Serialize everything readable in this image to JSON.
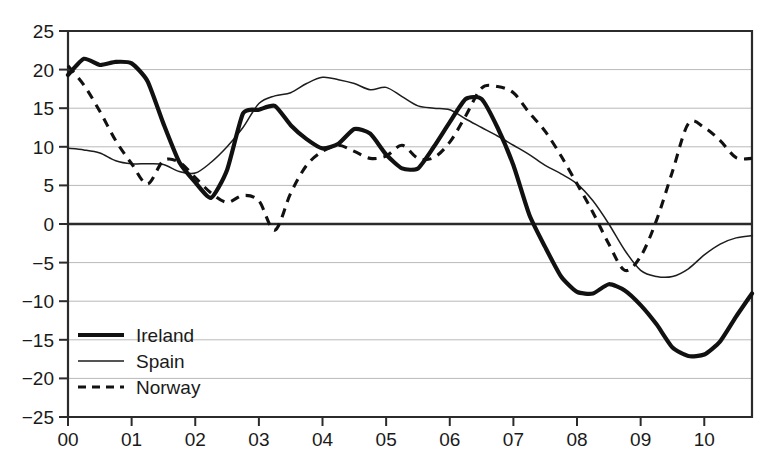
{
  "chart_data": {
    "type": "line",
    "title": "",
    "subtitle": "",
    "xlabel": "",
    "ylabel": "",
    "xlim": [
      0,
      10.75
    ],
    "ylim": [
      -25,
      25
    ],
    "grid": true,
    "legend_position": "bottom-left",
    "x_tick_labels": [
      "00",
      "01",
      "02",
      "03",
      "04",
      "05",
      "06",
      "07",
      "08",
      "09",
      "10"
    ],
    "x_tick_values": [
      0,
      1,
      2,
      3,
      4,
      5,
      6,
      7,
      8,
      9,
      10
    ],
    "y_tick_labels": [
      "25",
      "20",
      "15",
      "10",
      "5",
      "0",
      "-5",
      "-10",
      "-15",
      "-20",
      "-25"
    ],
    "y_tick_values": [
      25,
      20,
      15,
      10,
      5,
      0,
      -5,
      -10,
      -15,
      -20,
      -25
    ],
    "x": [
      0,
      0.25,
      0.5,
      0.75,
      1,
      1.25,
      1.5,
      1.75,
      2,
      2.25,
      2.5,
      2.75,
      3,
      3.25,
      3.5,
      3.75,
      4,
      4.25,
      4.5,
      4.75,
      5,
      5.25,
      5.5,
      5.75,
      6,
      6.25,
      6.5,
      6.75,
      7,
      7.25,
      7.5,
      7.75,
      8,
      8.25,
      8.5,
      8.75,
      9,
      9.25,
      9.5,
      9.75,
      10,
      10.25,
      10.5,
      10.75
    ],
    "series": [
      {
        "name": "Ireland",
        "style": "thick-solid",
        "color": "#111111",
        "values": [
          19.3,
          21.4,
          20.6,
          21.0,
          20.8,
          18.5,
          13.0,
          8.0,
          5.4,
          3.4,
          7.0,
          14.3,
          14.8,
          15.3,
          12.8,
          11.0,
          9.8,
          10.4,
          12.3,
          11.7,
          9.0,
          7.2,
          7.2,
          10.0,
          13.2,
          16.2,
          16.2,
          12.5,
          7.6,
          1.2,
          -3.0,
          -6.8,
          -8.8,
          -9.0,
          -7.8,
          -8.6,
          -10.5,
          -13.0,
          -16.0,
          -17.1,
          -16.9,
          -15.2,
          -12.0,
          -9.0
        ]
      },
      {
        "name": "Spain",
        "style": "thin-solid",
        "color": "#1d1d1d",
        "values": [
          9.8,
          9.6,
          9.2,
          8.2,
          7.8,
          7.8,
          7.7,
          6.8,
          6.6,
          8.0,
          10.0,
          12.5,
          15.6,
          16.6,
          17.0,
          18.2,
          19.0,
          18.7,
          18.2,
          17.4,
          17.7,
          16.5,
          15.3,
          15.0,
          14.8,
          13.6,
          12.5,
          11.4,
          10.2,
          9.0,
          7.6,
          6.5,
          5.2,
          3.0,
          0.0,
          -3.4,
          -6.0,
          -6.8,
          -6.8,
          -5.8,
          -4.0,
          -2.6,
          -1.8,
          -1.5
        ]
      },
      {
        "name": "Norway",
        "style": "dashed",
        "color": "#111111",
        "values": [
          20.5,
          18.0,
          14.6,
          10.8,
          7.8,
          5.2,
          8.2,
          8.0,
          6.0,
          4.0,
          2.8,
          3.7,
          3.0,
          -0.8,
          4.0,
          7.6,
          9.4,
          10.2,
          9.4,
          8.5,
          8.8,
          10.2,
          8.5,
          8.6,
          10.6,
          14.0,
          17.6,
          17.8,
          17.0,
          14.4,
          12.0,
          8.8,
          5.2,
          1.5,
          -2.6,
          -6.0,
          -4.2,
          0.5,
          6.8,
          13.0,
          12.5,
          10.8,
          8.6,
          8.5
        ]
      }
    ]
  },
  "legend": {
    "items": [
      {
        "label": "Ireland",
        "style": "thick-solid"
      },
      {
        "label": "Spain",
        "style": "thin-solid"
      },
      {
        "label": "Norway",
        "style": "dashed"
      }
    ]
  }
}
